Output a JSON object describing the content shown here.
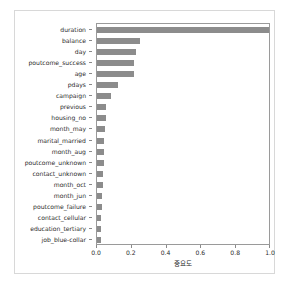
{
  "figure": {
    "background_color": "#ffffff",
    "frame_color": "#d8d8d8",
    "axes_color": "#9a9a9a",
    "bar_color": "#8c8c8c",
    "caption": ""
  },
  "chart_data": {
    "type": "bar",
    "orientation": "horizontal",
    "title": "",
    "xlabel": "중요도",
    "ylabel": "",
    "xlim": [
      0.0,
      1.0
    ],
    "xticks": [
      "0.0",
      "0.2",
      "0.4",
      "0.6",
      "0.8",
      "1.0"
    ],
    "xtick_values": [
      0.0,
      0.2,
      0.4,
      0.6,
      0.8,
      1.0
    ],
    "grid": false,
    "legend": null,
    "categories": [
      "duration",
      "balance",
      "day",
      "poutcome_success",
      "age",
      "pdays",
      "campaign",
      "previous",
      "housing_no",
      "month_may",
      "marital_married",
      "month_aug",
      "poutcome_unknown",
      "contact_unknown",
      "month_oct",
      "month_jun",
      "poutcome_failure",
      "contact_cellular",
      "education_tertiary",
      "job_blue-collar"
    ],
    "values": [
      1.0,
      0.245,
      0.225,
      0.215,
      0.21,
      0.12,
      0.08,
      0.052,
      0.05,
      0.046,
      0.042,
      0.04,
      0.038,
      0.034,
      0.032,
      0.028,
      0.026,
      0.024,
      0.022,
      0.022
    ]
  }
}
